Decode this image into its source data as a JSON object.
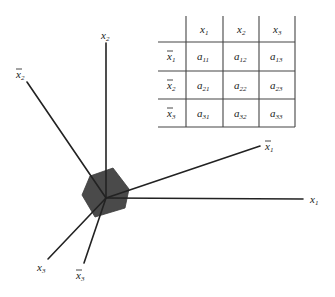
{
  "diagram": {
    "type": "axes-with-transformation-matrix",
    "colors": {
      "background": "#ffffff",
      "axis": "#222222",
      "hexagon": "#4a4a4a",
      "grid": "#444444"
    },
    "axes": [
      {
        "id": "x1",
        "base": "x",
        "sub": "1",
        "bar": false
      },
      {
        "id": "x2",
        "base": "x",
        "sub": "2",
        "bar": false
      },
      {
        "id": "x3",
        "base": "x",
        "sub": "3",
        "bar": false
      },
      {
        "id": "xbar1",
        "base": "x",
        "sub": "1",
        "bar": true
      },
      {
        "id": "xbar2",
        "base": "x",
        "sub": "2",
        "bar": true
      },
      {
        "id": "xbar3",
        "base": "x",
        "sub": "3",
        "bar": true
      }
    ],
    "table": {
      "column_headers": [
        {
          "base": "x",
          "sub": "1"
        },
        {
          "base": "x",
          "sub": "2"
        },
        {
          "base": "x",
          "sub": "3"
        }
      ],
      "row_headers": [
        {
          "base": "x",
          "sub": "1",
          "bar": true
        },
        {
          "base": "x",
          "sub": "2",
          "bar": true
        },
        {
          "base": "x",
          "sub": "3",
          "bar": true
        }
      ],
      "cells": [
        [
          {
            "base": "a",
            "sub": "11"
          },
          {
            "base": "a",
            "sub": "12"
          },
          {
            "base": "a",
            "sub": "13"
          }
        ],
        [
          {
            "base": "a",
            "sub": "21"
          },
          {
            "base": "a",
            "sub": "22"
          },
          {
            "base": "a",
            "sub": "23"
          }
        ],
        [
          {
            "base": "a",
            "sub": "31"
          },
          {
            "base": "a",
            "sub": "32"
          },
          {
            "base": "a",
            "sub": "33"
          }
        ]
      ]
    }
  }
}
